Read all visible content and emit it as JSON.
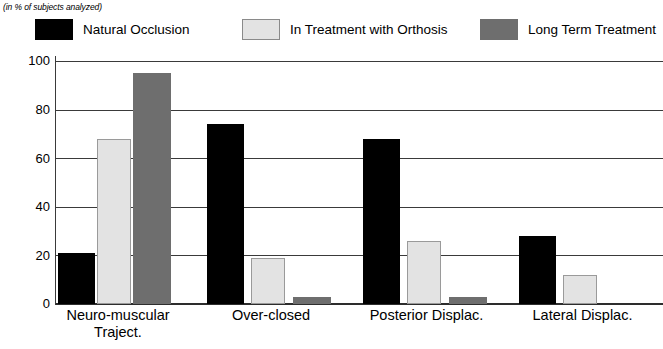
{
  "subtitle": "(in % of subjects analyzed)",
  "colors": {
    "series_natural": "#000000",
    "series_orthosis": "#e3e3e3",
    "series_longterm": "#6e6e6e",
    "axis": "#2d2d2d",
    "grid": "#3a3a3a",
    "background": "#ffffff"
  },
  "legend": {
    "items": [
      {
        "label": "Natural  Occlusion",
        "color": "#000000",
        "swatch_name": "legend-swatch-natural-occlusion"
      },
      {
        "label": "In Treatment with Orthosis",
        "color": "#e3e3e3",
        "swatch_name": "legend-swatch-in-treatment-with-orthosis"
      },
      {
        "label": "Long  Term  Treatment",
        "color": "#6e6e6e",
        "swatch_name": "legend-swatch-long-term-treatment"
      }
    ]
  },
  "axis": {
    "y_ticks": [
      "0",
      "20",
      "40",
      "60",
      "80",
      "100"
    ],
    "x_labels": [
      {
        "line1": "Neuro-muscular",
        "line2": "Traject."
      },
      {
        "line1": "Over-closed",
        "line2": ""
      },
      {
        "line1": "Posterior Displac.",
        "line2": ""
      },
      {
        "line1": "Lateral Displac.",
        "line2": ""
      }
    ]
  },
  "chart_data": {
    "type": "bar",
    "title": "",
    "subtitle": "(in % of subjects analyzed)",
    "xlabel": "",
    "ylabel": "",
    "ylim": [
      0,
      100
    ],
    "yticks": [
      0,
      20,
      40,
      60,
      80,
      100
    ],
    "grid": true,
    "legend_position": "top",
    "categories": [
      "Neuro-muscular Traject.",
      "Over-closed",
      "Posterior Displac.",
      "Lateral Displac."
    ],
    "series": [
      {
        "name": "Natural  Occlusion",
        "color": "#000000",
        "values": [
          21,
          74,
          68,
          28
        ]
      },
      {
        "name": "In Treatment with Orthosis",
        "color": "#e3e3e3",
        "values": [
          68,
          19,
          26,
          12
        ]
      },
      {
        "name": "Long  Term  Treatment",
        "color": "#6e6e6e",
        "values": [
          95,
          3,
          3,
          0
        ]
      }
    ]
  }
}
